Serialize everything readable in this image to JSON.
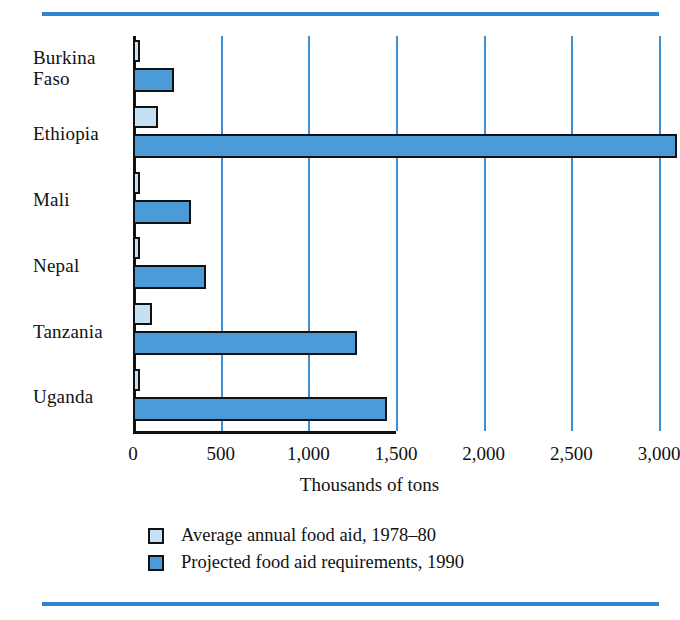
{
  "chart_data": {
    "type": "bar",
    "orientation": "horizontal",
    "title": "",
    "xlabel": "Thousands of tons",
    "ylabel": "",
    "xlim": [
      0,
      3150
    ],
    "xticks": [
      0,
      500,
      1000,
      1500,
      2000,
      2500,
      3000
    ],
    "xtick_labels": [
      "0",
      "500",
      "1,000",
      "1,500",
      "2,000",
      "2,500",
      "3,000"
    ],
    "grid": "vertical",
    "legend_position": "below-axis",
    "categories": [
      "Burkina Faso",
      "Ethiopia",
      "Mali",
      "Nepal",
      "Tanzania",
      "Uganda"
    ],
    "category_labels": [
      [
        "Burkina",
        "Faso"
      ],
      [
        "Ethiopia"
      ],
      [
        "Mali"
      ],
      [
        "Nepal"
      ],
      [
        "Tanzania"
      ],
      [
        "Uganda"
      ]
    ],
    "series": [
      {
        "name": "Average annual food aid, 1978–80",
        "color": "#c5e0f2",
        "values": [
          25,
          140,
          15,
          20,
          110,
          25
        ]
      },
      {
        "name": "Projected food aid requirements, 1990",
        "color": "#4a9bd8",
        "values": [
          235,
          3100,
          330,
          415,
          1280,
          1450
        ]
      }
    ]
  },
  "legend": {
    "items": [
      {
        "label": "Average annual food aid, 1978–80",
        "color": "#c5e0f2"
      },
      {
        "label": "Projected food aid requirements, 1990",
        "color": "#4a9bd8"
      }
    ]
  },
  "colors": {
    "light_bar": "#c5e0f2",
    "dark_bar": "#4a9bd8",
    "gridline": "#3d8fd4",
    "rule": "#2f86cf",
    "outline": "#111111"
  }
}
